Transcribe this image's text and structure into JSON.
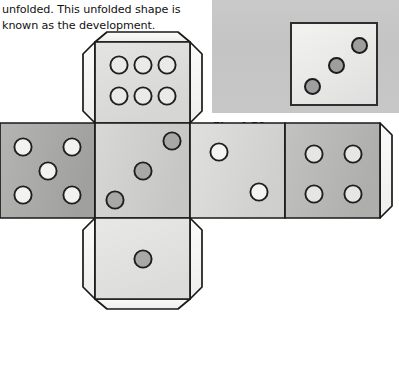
{
  "page": {
    "background": "#ffffff",
    "width": 399,
    "height": 365
  },
  "body_text": {
    "line1": "unfolded. This unfolded shape is",
    "line2": "known as the development."
  },
  "figure": {
    "caption": "Fig. 4.50",
    "photo": {
      "background_color": "#c6c6c6",
      "dice_faces": [
        {
          "name": "photo-die-face-three",
          "pip_count": 3,
          "pattern": "diagonal",
          "face_fill": "#ecece9",
          "pip_fill": "#9e9e9e",
          "outline": "#2e2e2e",
          "pips": [
            {
              "cx": 20,
              "cy": 63,
              "r": 8.5
            },
            {
              "cx": 44,
              "cy": 42,
              "r": 8.5
            },
            {
              "cx": 67,
              "cy": 22,
              "r": 8.5
            }
          ]
        },
        {
          "name": "photo-die-face-partial",
          "pip_count": 0,
          "pattern": "cropped",
          "face_fill": "#ecece9",
          "pip_fill": "#9e9e9e",
          "outline": "#2e2e2e",
          "pips": []
        }
      ]
    }
  },
  "net": {
    "description": "Development (net) of a cube drawn as a cross of six square faces with glue tabs",
    "outline_color": "#1a1a1a",
    "face_size": 95,
    "faces": [
      {
        "id": "top",
        "name": "net-face-six",
        "pip_count": 6,
        "fill": "#dededc",
        "pip_fill": "#e8e8e6",
        "pip_stroke": "#2a2a2a",
        "x": 95,
        "y": 0,
        "pips": [
          {
            "cx": 24,
            "cy": 33,
            "r": 9.5
          },
          {
            "cx": 48,
            "cy": 33,
            "r": 9.5
          },
          {
            "cx": 72,
            "cy": 33,
            "r": 9.5
          },
          {
            "cx": 24,
            "cy": 62,
            "r": 9.5
          },
          {
            "cx": 48,
            "cy": 62,
            "r": 9.5
          },
          {
            "cx": 72,
            "cy": 62,
            "r": 9.5
          }
        ]
      },
      {
        "id": "left",
        "name": "net-face-five",
        "pip_count": 5,
        "fill": "#a9a9a9",
        "pip_fill": "#f0f0ee",
        "pip_stroke": "#1f1f1f",
        "x": 0,
        "y": 95,
        "pips": [
          {
            "cx": 23,
            "cy": 23,
            "r": 9.5
          },
          {
            "cx": 72,
            "cy": 23,
            "r": 9.5
          },
          {
            "cx": 48,
            "cy": 48,
            "r": 9.5
          },
          {
            "cx": 23,
            "cy": 73,
            "r": 9.5
          },
          {
            "cx": 72,
            "cy": 73,
            "r": 9.5
          }
        ]
      },
      {
        "id": "front",
        "name": "net-face-three",
        "pip_count": 3,
        "fill": "#cfcfcd",
        "pip_fill": "#a5a5a5",
        "pip_stroke": "#1f1f1f",
        "x": 95,
        "y": 95,
        "pips": [
          {
            "cx": 20,
            "cy": 76,
            "r": 9.5
          },
          {
            "cx": 48,
            "cy": 48,
            "r": 9.5
          },
          {
            "cx": 76,
            "cy": 20,
            "r": 9.5
          }
        ]
      },
      {
        "id": "right",
        "name": "net-face-two",
        "pip_count": 2,
        "fill": "#d8d8d6",
        "pip_fill": "#f2f2f0",
        "pip_stroke": "#1f1f1f",
        "x": 190,
        "y": 95,
        "pips": [
          {
            "cx": 28,
            "cy": 28,
            "r": 9.5
          },
          {
            "cx": 68,
            "cy": 68,
            "r": 9.5
          }
        ]
      },
      {
        "id": "back",
        "name": "net-face-four",
        "pip_count": 4,
        "fill": "#b8b8b6",
        "pip_fill": "#e4e4e2",
        "pip_stroke": "#1f1f1f",
        "x": 285,
        "y": 95,
        "pips": [
          {
            "cx": 28,
            "cy": 30,
            "r": 9.5
          },
          {
            "cx": 68,
            "cy": 30,
            "r": 9.5
          },
          {
            "cx": 28,
            "cy": 70,
            "r": 9.5
          },
          {
            "cx": 68,
            "cy": 70,
            "r": 9.5
          }
        ]
      },
      {
        "id": "bottom",
        "name": "net-face-one",
        "pip_count": 1,
        "fill": "#e2e2e0",
        "pip_fill": "#a5a5a5",
        "pip_stroke": "#1f1f1f",
        "x": 95,
        "y": 190,
        "pips": [
          {
            "cx": 48,
            "cy": 48,
            "r": 9.5
          }
        ]
      }
    ],
    "tabs": [
      {
        "name": "tab-top",
        "position": "top-of-top-face"
      },
      {
        "name": "tab-top-left",
        "position": "left-of-top-face"
      },
      {
        "name": "tab-top-right",
        "position": "right-of-top-face"
      },
      {
        "name": "tab-bottom",
        "position": "bottom-of-bottom-face"
      },
      {
        "name": "tab-bottom-left",
        "position": "left-of-bottom-face"
      },
      {
        "name": "tab-bottom-right",
        "position": "right-of-bottom-face"
      },
      {
        "name": "tab-right-edge",
        "position": "right-of-back-face"
      }
    ]
  }
}
